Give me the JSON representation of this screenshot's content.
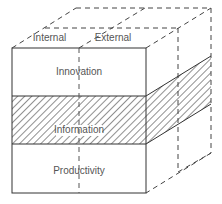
{
  "diagram": {
    "type": "3d-cube-matrix",
    "columns": [
      "Internal",
      "External"
    ],
    "rows": [
      "Innovation",
      "Information",
      "Productivity"
    ],
    "highlighted_row": "Information",
    "colors": {
      "line": "#333333",
      "hatch": "#444444",
      "text": "#555555",
      "background": "#ffffff"
    }
  }
}
